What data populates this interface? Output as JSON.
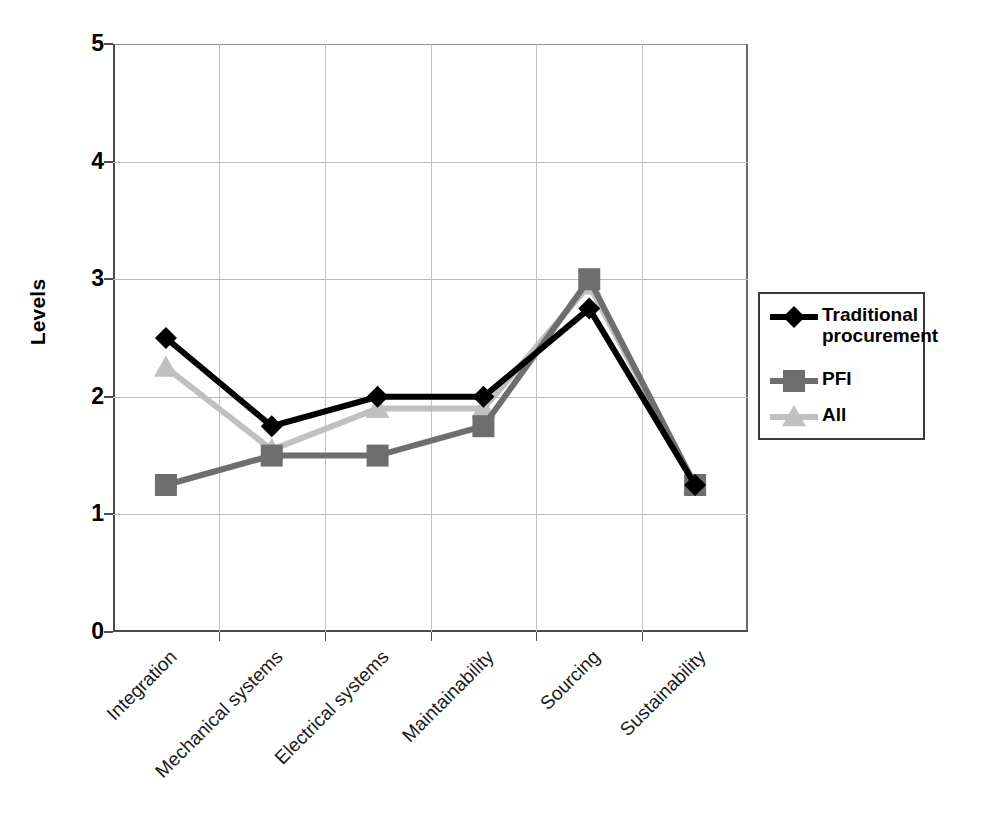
{
  "chart_data": {
    "type": "line",
    "title": "",
    "xlabel": "",
    "ylabel": "Levels",
    "ylim": [
      0,
      5
    ],
    "ytick_labels": [
      "5",
      "4",
      "3",
      "2",
      "1",
      "0"
    ],
    "ytick_values": [
      5,
      4,
      3,
      2,
      1,
      0
    ],
    "grid": true,
    "legend_position": "right",
    "categories": [
      "Integration",
      "Mechanical systems",
      "Electrical systems",
      "Maintainability",
      "Sourcing",
      "Sustainability"
    ],
    "series": [
      {
        "name": "Traditional procurement",
        "color": "#000000",
        "marker": "diamond",
        "values": [
          2.5,
          1.75,
          2.0,
          2.0,
          2.75,
          1.25
        ]
      },
      {
        "name": "PFI",
        "color": "#6e6e6e",
        "marker": "square",
        "values": [
          1.25,
          1.5,
          1.5,
          1.75,
          3.0,
          1.25
        ]
      },
      {
        "name": "All",
        "color": "#c0c0c0",
        "marker": "triangle",
        "values": [
          2.25,
          1.55,
          1.9,
          1.9,
          2.95,
          1.25
        ]
      }
    ]
  },
  "legend": {
    "items": [
      {
        "label": "Traditional procurement",
        "color": "#000000",
        "marker": "diamond"
      },
      {
        "label": "PFI",
        "color": "#6e6e6e",
        "marker": "square"
      },
      {
        "label": "All",
        "color": "#c0c0c0",
        "marker": "triangle"
      }
    ]
  }
}
